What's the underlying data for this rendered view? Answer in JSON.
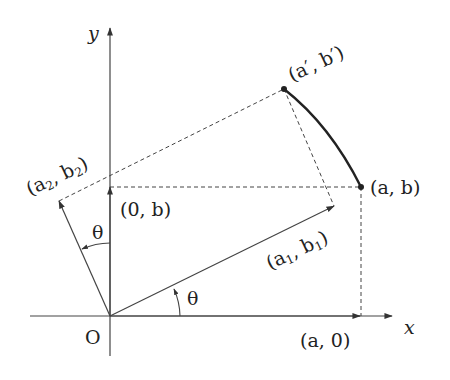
{
  "diagram": {
    "type": "rotation-of-point-about-origin",
    "axes": {
      "x_label": "x",
      "y_label": "y",
      "origin_label": "O"
    },
    "points": {
      "a_b": "(a, b)",
      "a_prime_b_prime": "(a′, b′)",
      "a_0": "(a, 0)",
      "zero_b": "(0, b)",
      "a1_b1": {
        "pre": "(a",
        "sub1": "1",
        "mid": ", b",
        "sub2": "1",
        "post": ")"
      },
      "a2_b2": {
        "pre": "(a",
        "sub1": "2",
        "mid": ", b",
        "sub2": "2",
        "post": ")"
      }
    },
    "angles": {
      "theta_lower": "θ",
      "theta_upper": "θ"
    },
    "colors": {
      "line": "#333333",
      "text": "#222222",
      "background": "#ffffff"
    }
  }
}
